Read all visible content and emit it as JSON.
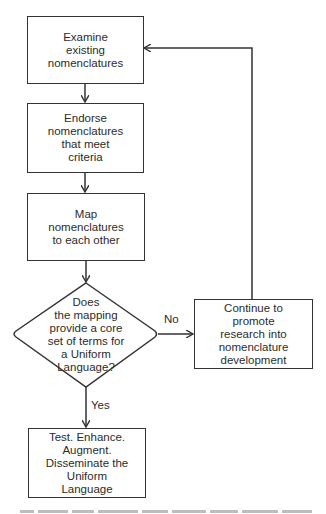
{
  "diagram": {
    "type": "flowchart",
    "nodes": {
      "examine": {
        "text": "Examine\nexisting\nnomenclatures"
      },
      "endorse": {
        "text": "Endorse\nnomenclatures\nthat meet\ncriteria"
      },
      "map": {
        "text": "Map\nnomenclatures\nto each other"
      },
      "decision": {
        "text": "Does\nthe mapping\nprovide a core\nset of terms for\na Uniform\nLanguage?"
      },
      "continue": {
        "text": "Continue to\npromote\nresearch into\nnomenclature\ndevelopment"
      },
      "test": {
        "text": "Test. Enhance.\nAugment.\nDisseminate the\nUniform\nLanguage"
      }
    },
    "edges": [
      {
        "from": "examine",
        "to": "endorse",
        "label": ""
      },
      {
        "from": "endorse",
        "to": "map",
        "label": ""
      },
      {
        "from": "map",
        "to": "decision",
        "label": ""
      },
      {
        "from": "decision",
        "to": "continue",
        "label": "No"
      },
      {
        "from": "decision",
        "to": "test",
        "label": "Yes"
      },
      {
        "from": "continue",
        "to": "examine",
        "label": ""
      }
    ],
    "labels": {
      "no": "No",
      "yes": "Yes"
    },
    "colors": {
      "line": "#333333",
      "text": "#2c2c2c",
      "background": "#ffffff"
    }
  }
}
